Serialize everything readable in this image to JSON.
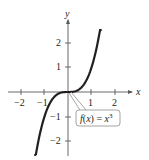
{
  "chart_data": {
    "type": "line",
    "title": "",
    "xlabel": "x",
    "ylabel": "y",
    "function": "x^3",
    "annotation": "f(x) = x³",
    "xlim": [
      -2.6,
      2.6
    ],
    "ylim": [
      -2.6,
      2.6
    ],
    "x_ticks": [
      -2,
      -1,
      1,
      2
    ],
    "y_ticks": [
      -2,
      -1,
      1,
      2
    ],
    "x_tick_labels": [
      "−2",
      "−1",
      "1",
      "2"
    ],
    "y_tick_labels": [
      "−2",
      "−1",
      "1",
      "2"
    ],
    "grid": false,
    "legend": "none",
    "series": [
      {
        "name": "f(x) = x^3",
        "x": [
          -1.4,
          -1.2,
          -1.0,
          -0.8,
          -0.6,
          -0.4,
          -0.2,
          0,
          0.2,
          0.4,
          0.6,
          0.8,
          1.0,
          1.2,
          1.4
        ],
        "y": [
          -2.744,
          -1.728,
          -1.0,
          -0.512,
          -0.216,
          -0.064,
          -0.008,
          0,
          0.008,
          0.064,
          0.216,
          0.512,
          1.0,
          1.728,
          2.744
        ]
      }
    ]
  },
  "labels": {
    "x_axis": "x",
    "y_axis": "y",
    "callout_prefix": "f(x) = x",
    "callout_exp": "3"
  },
  "colors": {
    "curve": "#231f20",
    "axis": "#5a5a5a",
    "callout_border": "#9a9a9a"
  }
}
